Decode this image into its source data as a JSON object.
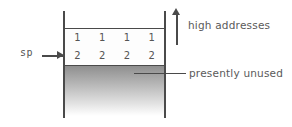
{
  "diagram": {
    "colors": {
      "line": "#4a4a4a",
      "text": "#555555",
      "annotation_text": "#5a5a5a",
      "unused_top": "#8e8e8e",
      "unused_bottom": "#ffffff",
      "background": "#ffffff"
    },
    "pointer": {
      "label": "sp",
      "arrow_direction": "right",
      "points_to": "row-of-twos"
    },
    "rows": [
      {
        "id": "row-ones",
        "cells": [
          "1",
          "1",
          "1",
          "1"
        ]
      },
      {
        "id": "row-twos",
        "cells": [
          "2",
          "2",
          "2",
          "2"
        ]
      }
    ],
    "annotations": [
      {
        "id": "high-addresses",
        "text": "high addresses",
        "marker": "up-arrow"
      },
      {
        "id": "presently-unused",
        "text": "presently unused",
        "marker": "leader-line"
      }
    ],
    "regions": [
      {
        "id": "unused",
        "label": "presently unused",
        "fill": "gradient-gray-to-white"
      }
    ]
  }
}
